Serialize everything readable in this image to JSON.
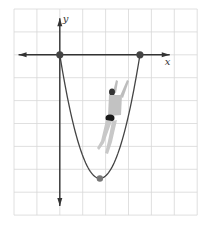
{
  "diagram": {
    "grid": {
      "x_min": -2,
      "x_max": 6,
      "y_min": -7,
      "y_max": 2,
      "step": 1
    },
    "axes": {
      "x_label": "x",
      "y_label": "y"
    },
    "points": [
      {
        "name": "origin",
        "x": 0,
        "y": 0
      },
      {
        "name": "x-intercept",
        "x": 3.5,
        "y": 0
      },
      {
        "name": "vertex",
        "x": 1.75,
        "y": -5.4
      }
    ],
    "curve": {
      "type": "parabola",
      "roots": [
        0,
        3.5
      ],
      "vertex": [
        1.75,
        -5.4
      ]
    },
    "colors": {
      "grid": "#d8d8d8",
      "axis": "#333333",
      "curve": "#444444",
      "point": "#444444",
      "vertex_point": "#777777",
      "figure": "#b8b8b8",
      "figure_dark": "#222222"
    }
  }
}
